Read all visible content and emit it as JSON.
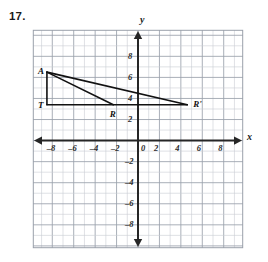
{
  "problem": {
    "number": "17."
  },
  "graph": {
    "axis_labels": {
      "x": "x",
      "y": "y"
    },
    "origin_label": "0",
    "x_ticks": [
      {
        "value": -8,
        "label": "–8"
      },
      {
        "value": -6,
        "label": "–6"
      },
      {
        "value": -4,
        "label": "–4"
      },
      {
        "value": -2,
        "label": "–2"
      },
      {
        "value": 2,
        "label": "2"
      },
      {
        "value": 4,
        "label": "4"
      },
      {
        "value": 6,
        "label": "6"
      },
      {
        "value": 8,
        "label": "8"
      }
    ],
    "y_ticks": [
      {
        "value": 8,
        "label": "8"
      },
      {
        "value": 6,
        "label": "6"
      },
      {
        "value": 4,
        "label": "4"
      },
      {
        "value": 2,
        "label": "2"
      },
      {
        "value": -2,
        "label": "–2"
      },
      {
        "value": -4,
        "label": "–4"
      },
      {
        "value": -6,
        "label": "–6"
      },
      {
        "value": -8,
        "label": "–8"
      }
    ],
    "x_range": [
      -9.8,
      9.8
    ],
    "y_range": [
      -10.2,
      10.5
    ],
    "grid_step": 1,
    "grid_color": "#c9ccd4",
    "grid_major_color": "#9aa0ab",
    "axis_color": "#262626",
    "figure_color": "#111111",
    "background": "#ffffff"
  },
  "chart_data": {
    "type": "scatter",
    "title": "",
    "xlabel": "x",
    "ylabel": "y",
    "xlim": [
      -9.8,
      9.8
    ],
    "ylim": [
      -10.2,
      10.5
    ],
    "grid": true,
    "legend": "none",
    "points": [
      {
        "name": "A",
        "label": "A",
        "x": -8.5,
        "y": 6.5
      },
      {
        "name": "T",
        "label": "T",
        "x": -8.5,
        "y": 3.4
      },
      {
        "name": "R",
        "label": "R",
        "x": -2.3,
        "y": 3.4
      },
      {
        "name": "R'",
        "label": "R'",
        "x": 4.6,
        "y": 3.4
      }
    ],
    "segments": [
      {
        "name": "A-T",
        "from": "A",
        "to": "T"
      },
      {
        "name": "T-R'",
        "from": "T",
        "to": "R'"
      },
      {
        "name": "A-R",
        "from": "A",
        "to": "R"
      },
      {
        "name": "A-R'",
        "from": "A",
        "to": "R'"
      }
    ],
    "annotations": [
      {
        "text": "A",
        "x": -8.5,
        "y": 6.5
      },
      {
        "text": "T",
        "x": -8.5,
        "y": 3.4
      },
      {
        "text": "R",
        "x": -2.3,
        "y": 3.4
      },
      {
        "text": "R'",
        "x": 4.6,
        "y": 3.4
      }
    ]
  }
}
